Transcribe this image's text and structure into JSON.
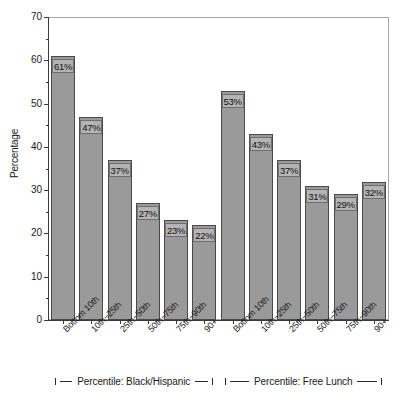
{
  "chart_data": {
    "type": "bar",
    "title": "",
    "subtitle": "",
    "xlabel": "",
    "ylabel": "Percentage",
    "ylim": [
      0,
      70
    ],
    "ytick_step": 10,
    "yminor_step": 5,
    "ytick_labels": [
      "0",
      "10",
      "20",
      "30",
      "40",
      "50",
      "60",
      "70"
    ],
    "grid": false,
    "legend": "none",
    "bar_color": "#9a9a9a",
    "bar_border_color": "#4a4a4a",
    "frame_color": "#a8a8a8",
    "axis_color": "#3a3a3a",
    "categories": [
      "Bottom 10th",
      "10th−25th",
      "25th−50th",
      "50th−75th",
      "75th−90th",
      "90+",
      "Bottom 10th",
      "10th−25th",
      "25th−50th",
      "50th−75th",
      "75th−90th",
      "90+"
    ],
    "values": [
      61,
      47,
      37,
      27,
      23,
      22,
      53,
      43,
      37,
      31,
      29,
      32
    ],
    "data_labels": [
      "61%",
      "47%",
      "37%",
      "27%",
      "23%",
      "22%",
      "53%",
      "43%",
      "37%",
      "31%",
      "29%",
      "32%"
    ],
    "groups": [
      {
        "label": "Percentile: Black/Hispanic",
        "categories": [
          "Bottom 10th",
          "10th−25th",
          "25th−50th",
          "50th−75th",
          "75th−90th",
          "90+"
        ],
        "values": [
          61,
          47,
          37,
          27,
          23,
          22
        ]
      },
      {
        "label": "Percentile: Free Lunch",
        "categories": [
          "Bottom 10th",
          "10th−25th",
          "25th−50th",
          "50th−75th",
          "75th−90th",
          "90+"
        ],
        "values": [
          53,
          43,
          37,
          31,
          29,
          32
        ]
      }
    ]
  }
}
